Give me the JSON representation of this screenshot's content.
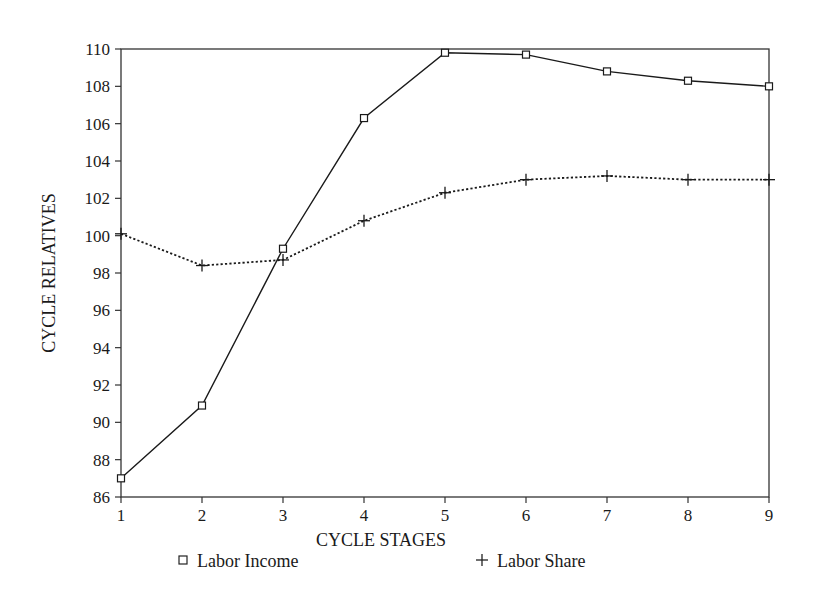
{
  "chart_data": {
    "type": "line",
    "title": "",
    "xlabel": "CYCLE STAGES",
    "ylabel": "CYCLE RELATIVES",
    "x": [
      1,
      2,
      3,
      4,
      5,
      6,
      7,
      8,
      9
    ],
    "xticks": [
      "1",
      "2",
      "3",
      "4",
      "5",
      "6",
      "7",
      "8",
      "9"
    ],
    "yticks": [
      "86",
      "88",
      "90",
      "92",
      "94",
      "96",
      "98",
      "100",
      "102",
      "104",
      "106",
      "108",
      "110"
    ],
    "ylim": [
      86,
      110
    ],
    "xlim": [
      1,
      9
    ],
    "grid": false,
    "legend_position": "bottom",
    "series": [
      {
        "name": "Labor Income",
        "marker": "square",
        "line": "solid",
        "color": "#1a1a1a",
        "values": [
          87.0,
          90.9,
          99.3,
          106.3,
          109.8,
          109.7,
          108.8,
          108.3,
          108.0
        ]
      },
      {
        "name": "Labor Share",
        "marker": "plus",
        "line": "dotted",
        "color": "#1a1a1a",
        "values": [
          100.1,
          98.4,
          98.7,
          100.8,
          102.3,
          103.0,
          103.2,
          103.0,
          103.0
        ]
      }
    ]
  },
  "legend": {
    "items": [
      {
        "label": "Labor Income",
        "symbol": "□"
      },
      {
        "label": "Labor Share",
        "symbol": "+"
      }
    ]
  }
}
